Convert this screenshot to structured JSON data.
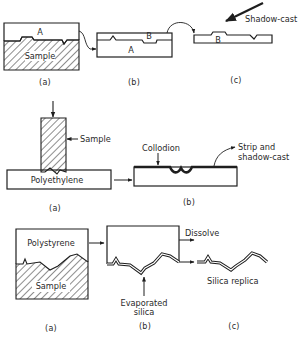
{
  "diagram": {
    "type": "process-schematic",
    "rows": [
      {
        "id": "row1",
        "panels": [
          {
            "id": "a",
            "caption": "(a)",
            "labels": {
              "top_layer": "A",
              "base": "Sample"
            }
          },
          {
            "id": "b",
            "caption": "(b)",
            "labels": {
              "top_layer": "B",
              "base_layer": "A"
            }
          },
          {
            "id": "c",
            "caption": "(c)",
            "labels": {
              "layer": "B",
              "arrow": "Shadow-cast"
            }
          }
        ]
      },
      {
        "id": "row2",
        "panels": [
          {
            "id": "a",
            "caption": "(a)",
            "labels": {
              "sample": "Sample",
              "substrate": "Polyethylene"
            }
          },
          {
            "id": "b",
            "caption": "(b)",
            "labels": {
              "film": "Collodion",
              "action": "Strip and\nshadow-cast",
              "action_line1": "Strip and",
              "action_line2": "shadow-cast"
            }
          }
        ]
      },
      {
        "id": "row3",
        "panels": [
          {
            "id": "a",
            "caption": "(a)",
            "labels": {
              "mould": "Polystyrene",
              "base": "Sample"
            }
          },
          {
            "id": "b",
            "caption": "(b)",
            "labels": {
              "action": "Dissolve",
              "deposit_line1": "Evaporated",
              "deposit_line2": "silica"
            }
          },
          {
            "id": "c",
            "caption": "(c)",
            "labels": {
              "result": "Silica replica"
            }
          }
        ]
      }
    ],
    "colors": {
      "ink": "#1e1e1e",
      "background": "#ffffff"
    }
  }
}
